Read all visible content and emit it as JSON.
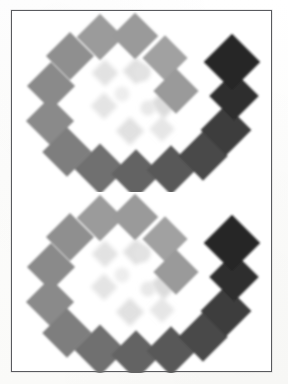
{
  "page": {
    "background_color": "#fdfdfc",
    "width": 288,
    "height": 384,
    "frame_color": "#595a5e",
    "frame_label": "figure-border"
  },
  "figure": {
    "title": "",
    "caption": "",
    "panel_count": 2,
    "panels": [
      {
        "id": "upper",
        "label": ""
      },
      {
        "id": "lower",
        "label": ""
      }
    ]
  },
  "chart_data": {
    "type": "scatter",
    "title": "",
    "xlabel": "",
    "ylabel": "",
    "grid": false,
    "legend": "none",
    "note": "Positions are in panel coordinate units (261 x 181). Each mark is a square rotated 45 degrees. 'value' is the printed gray level 0-100 where 0 = white and 100 = black.",
    "series": [
      {
        "name": "outer-arc",
        "marker": "diamond",
        "points": [
          {
            "x": 88,
            "y": 26,
            "size": 33,
            "color": "#9b9b9b",
            "value": 39,
            "rot": 45
          },
          {
            "x": 123,
            "y": 25,
            "size": 33,
            "color": "#9a9a9a",
            "value": 40,
            "rot": 45
          },
          {
            "x": 58,
            "y": 45,
            "size": 34,
            "color": "#8f8f8f",
            "value": 44,
            "rot": 45
          },
          {
            "x": 153,
            "y": 47,
            "size": 32,
            "color": "#a1a1a1",
            "value": 37,
            "rot": 45
          },
          {
            "x": 39,
            "y": 75,
            "size": 34,
            "color": "#8a8a8a",
            "value": 46,
            "rot": 45
          },
          {
            "x": 164,
            "y": 80,
            "size": 32,
            "color": "#9a9a9a",
            "value": 40,
            "rot": 45
          },
          {
            "x": 38,
            "y": 110,
            "size": 34,
            "color": "#8a8a8a",
            "value": 46,
            "rot": 45
          },
          {
            "x": 55,
            "y": 141,
            "size": 35,
            "color": "#7e7e7e",
            "value": 51,
            "rot": 45
          },
          {
            "x": 88,
            "y": 158,
            "size": 36,
            "color": "#6f6f6f",
            "value": 56,
            "rot": 45
          },
          {
            "x": 124,
            "y": 163,
            "size": 35,
            "color": "#636363",
            "value": 61,
            "rot": 45
          },
          {
            "x": 159,
            "y": 159,
            "size": 35,
            "color": "#595959",
            "value": 65,
            "rot": 45
          },
          {
            "x": 191,
            "y": 145,
            "size": 35,
            "color": "#4a4a4a",
            "value": 71,
            "rot": 45
          },
          {
            "x": 214,
            "y": 119,
            "size": 36,
            "color": "#3c3c3c",
            "value": 76,
            "rot": 45
          },
          {
            "x": 222,
            "y": 85,
            "size": 35,
            "color": "#2f2f2f",
            "value": 82,
            "rot": 45
          },
          {
            "x": 220,
            "y": 51,
            "size": 40,
            "color": "#262626",
            "value": 85,
            "rot": 45
          }
        ]
      },
      {
        "name": "inner-cluster",
        "marker": "diamond",
        "points": [
          {
            "x": 93,
            "y": 62,
            "size": 19,
            "color": "#e2e2e2",
            "value": 11,
            "rot": 45
          },
          {
            "x": 124,
            "y": 60,
            "size": 19,
            "color": "#e0e0e0",
            "value": 12,
            "rot": 45
          },
          {
            "x": 92,
            "y": 95,
            "size": 19,
            "color": "#e4e4e4",
            "value": 10,
            "rot": 45
          },
          {
            "x": 152,
            "y": 93,
            "size": 20,
            "color": "#dcdcdc",
            "value": 14,
            "rot": 45
          },
          {
            "x": 118,
            "y": 120,
            "size": 20,
            "color": "#e1e1e1",
            "value": 12,
            "rot": 45
          },
          {
            "x": 150,
            "y": 118,
            "size": 18,
            "color": "#e6e6e6",
            "value": 9,
            "rot": 45
          }
        ]
      },
      {
        "name": "inner-circles",
        "marker": "circle",
        "points": [
          {
            "x": 110,
            "y": 83,
            "size": 15,
            "color": "#ededed",
            "value": 7
          },
          {
            "x": 136,
            "y": 97,
            "size": 15,
            "color": "#e8e8e8",
            "value": 8
          },
          {
            "x": 130,
            "y": 62,
            "size": 17,
            "color": "#e3e3e3",
            "value": 11
          }
        ]
      }
    ],
    "xlim": [
      0,
      261
    ],
    "ylim": [
      0,
      181
    ]
  }
}
